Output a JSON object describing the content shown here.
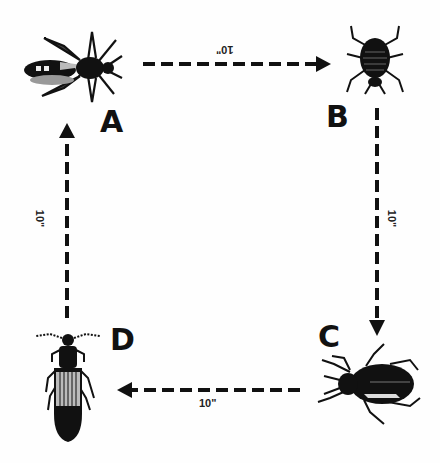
{
  "diagram": {
    "nodes": [
      {
        "id": "A",
        "label": "A",
        "icon": "bee-insect-icon"
      },
      {
        "id": "B",
        "label": "B",
        "icon": "bedbug-insect-icon"
      },
      {
        "id": "C",
        "label": "C",
        "icon": "ground-beetle-insect-icon"
      },
      {
        "id": "D",
        "label": "D",
        "icon": "click-beetle-insect-icon"
      }
    ],
    "edges": [
      {
        "from": "A",
        "to": "B",
        "distance": "10\""
      },
      {
        "from": "B",
        "to": "C",
        "distance": "10\""
      },
      {
        "from": "C",
        "to": "D",
        "distance": "10\""
      },
      {
        "from": "D",
        "to": "A",
        "distance": "10\""
      }
    ],
    "colors": {
      "ink": "#111111",
      "background": "#fefefe"
    }
  }
}
